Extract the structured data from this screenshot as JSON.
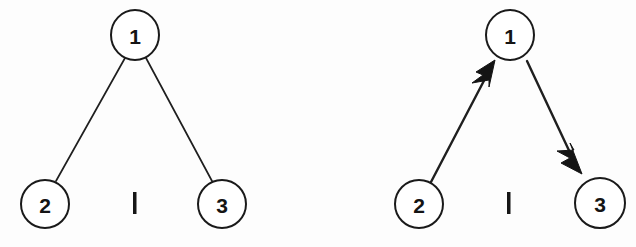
{
  "figure": {
    "background_color": "#fdfdfd",
    "ink_color": "#141414",
    "width": 636,
    "height": 247,
    "panels": [
      {
        "id": "left-panel",
        "kind": "undirected-graph",
        "caption": "",
        "nodes": [
          {
            "id": "n1",
            "label": "1",
            "cx": 135,
            "cy": 35,
            "rx": 24,
            "ry": 25,
            "stroke_width": 2
          },
          {
            "id": "n2",
            "label": "2",
            "cx": 45,
            "cy": 204,
            "rx": 24,
            "ry": 24,
            "stroke_width": 2
          },
          {
            "id": "n3",
            "label": "3",
            "cx": 222,
            "cy": 204,
            "rx": 24,
            "ry": 24,
            "stroke_width": 2
          }
        ],
        "edges": [
          {
            "id": "e1-2",
            "from": "n1",
            "to": "n2",
            "directed": false,
            "x1": 125,
            "y1": 58,
            "x2": 56,
            "y2": 181,
            "stroke_width": 1.7
          },
          {
            "id": "e1-3",
            "from": "n1",
            "to": "n3",
            "directed": false,
            "x1": 146,
            "y1": 58,
            "x2": 212,
            "y2": 181,
            "stroke_width": 1.7
          }
        ],
        "tick": {
          "id": "left-tick",
          "label": "I",
          "x": 133,
          "y": 192,
          "width": 3.5,
          "height": 22
        }
      },
      {
        "id": "right-panel",
        "kind": "directed-graph",
        "caption": "",
        "nodes": [
          {
            "id": "n1",
            "label": "1",
            "cx": 510,
            "cy": 35,
            "rx": 24,
            "ry": 25,
            "stroke_width": 2
          },
          {
            "id": "n2",
            "label": "2",
            "cx": 419,
            "cy": 204,
            "rx": 24,
            "ry": 24,
            "stroke_width": 2
          },
          {
            "id": "n3",
            "label": "3",
            "cx": 600,
            "cy": 203,
            "rx": 25,
            "ry": 25,
            "stroke_width": 2
          }
        ],
        "edges": [
          {
            "id": "e2-1",
            "from": "n2",
            "to": "n1",
            "directed": true,
            "x1": 431,
            "y1": 182,
            "x2": 494,
            "y2": 62,
            "stroke_width": 2.4
          },
          {
            "id": "e1-3",
            "from": "n1",
            "to": "n3",
            "directed": true,
            "x1": 527,
            "y1": 61,
            "x2": 580,
            "y2": 173,
            "stroke_width": 2.4
          }
        ],
        "tick": {
          "id": "right-tick",
          "label": "I",
          "x": 507,
          "y": 192,
          "width": 3.5,
          "height": 22
        }
      }
    ]
  },
  "accessibility": {
    "alt_text": "Two node-and-edge diagrams. Left: an undirected graph with node 1 on top connected by plain lines to nodes 2 and 3 below. Right: the same three nodes with directed arrows, one from node 2 to node 1 and one from node 1 to node 3."
  }
}
